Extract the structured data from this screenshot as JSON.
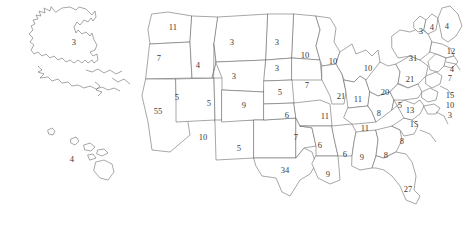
{
  "map": {
    "title": "United States electoral vote map",
    "background_color": "#ffffff",
    "outline_color": "#6b6b6b",
    "label_color": "#3a3a3a",
    "labels": [
      {
        "name": "alaska",
        "value": "3",
        "x": 74,
        "y": 42
      },
      {
        "name": "hawaii",
        "value": "4",
        "x": 72,
        "y": 159
      },
      {
        "name": "washington",
        "value": "11",
        "x": 173,
        "y": 27
      },
      {
        "name": "oregon",
        "value": "7",
        "x": 159,
        "y": 58
      },
      {
        "name": "california",
        "value": "55",
        "x": 158,
        "y": 111
      },
      {
        "name": "idaho",
        "value": "4",
        "x": 198,
        "y": 65
      },
      {
        "name": "nevada",
        "value": "5",
        "x": 177,
        "y": 97
      },
      {
        "name": "utah",
        "value": "5",
        "x": 209,
        "y": 103
      },
      {
        "name": "arizona",
        "value": "10",
        "x": 203,
        "y": 137
      },
      {
        "name": "montana",
        "value": "3",
        "x": 232,
        "y": 42
      },
      {
        "name": "wyoming",
        "value": "3",
        "x": 234,
        "y": 76
      },
      {
        "name": "colorado",
        "value": "9",
        "x": 244,
        "y": 105
      },
      {
        "name": "new-mexico",
        "value": "5",
        "x": 239,
        "y": 148
      },
      {
        "name": "north-dakota",
        "value": "3",
        "x": 277,
        "y": 42
      },
      {
        "name": "south-dakota",
        "value": "3",
        "x": 277,
        "y": 68
      },
      {
        "name": "nebraska",
        "value": "5",
        "x": 280,
        "y": 92
      },
      {
        "name": "kansas",
        "value": "6",
        "x": 287,
        "y": 115
      },
      {
        "name": "oklahoma",
        "value": "7",
        "x": 296,
        "y": 137
      },
      {
        "name": "texas",
        "value": "34",
        "x": 285,
        "y": 170
      },
      {
        "name": "minnesota",
        "value": "10",
        "x": 305,
        "y": 55
      },
      {
        "name": "iowa",
        "value": "7",
        "x": 307,
        "y": 85
      },
      {
        "name": "missouri",
        "value": "11",
        "x": 325,
        "y": 116
      },
      {
        "name": "arkansas",
        "value": "6",
        "x": 320,
        "y": 145
      },
      {
        "name": "louisiana",
        "value": "9",
        "x": 328,
        "y": 174
      },
      {
        "name": "wisconsin",
        "value": "10",
        "x": 333,
        "y": 61
      },
      {
        "name": "illinois",
        "value": "21",
        "x": 341,
        "y": 96
      },
      {
        "name": "mississippi",
        "value": "6",
        "x": 345,
        "y": 154
      },
      {
        "name": "michigan",
        "value": "10",
        "x": 368,
        "y": 68
      },
      {
        "name": "indiana",
        "value": "11",
        "x": 358,
        "y": 99
      },
      {
        "name": "tennessee",
        "value": "11",
        "x": 365,
        "y": 128
      },
      {
        "name": "alabama",
        "value": "9",
        "x": 362,
        "y": 157
      },
      {
        "name": "ohio",
        "value": "20",
        "x": 385,
        "y": 92
      },
      {
        "name": "kentucky",
        "value": "8",
        "x": 379,
        "y": 113
      },
      {
        "name": "georgia",
        "value": "8",
        "x": 386,
        "y": 155
      },
      {
        "name": "florida",
        "value": "27",
        "x": 408,
        "y": 189
      },
      {
        "name": "west-virginia",
        "value": "5",
        "x": 400,
        "y": 105
      },
      {
        "name": "south-carolina",
        "value": "8",
        "x": 402,
        "y": 141
      },
      {
        "name": "north-carolina",
        "value": "15",
        "x": 414,
        "y": 124
      },
      {
        "name": "virginia",
        "value": "13",
        "x": 410,
        "y": 110
      },
      {
        "name": "pennsylvania",
        "value": "21",
        "x": 410,
        "y": 79
      },
      {
        "name": "new-york",
        "value": "31",
        "x": 413,
        "y": 58
      },
      {
        "name": "vermont",
        "value": "3",
        "x": 421,
        "y": 31
      },
      {
        "name": "new-hampshire",
        "value": "4",
        "x": 432,
        "y": 27
      },
      {
        "name": "maine",
        "value": "4",
        "x": 447,
        "y": 26
      },
      {
        "name": "massachusetts",
        "value": "12",
        "x": 451,
        "y": 51
      },
      {
        "name": "rhode-island",
        "value": "4",
        "x": 452,
        "y": 69
      },
      {
        "name": "connecticut",
        "value": "7",
        "x": 450,
        "y": 78
      },
      {
        "name": "new-jersey",
        "value": "15",
        "x": 450,
        "y": 95
      },
      {
        "name": "maryland",
        "value": "10",
        "x": 450,
        "y": 105
      },
      {
        "name": "delaware",
        "value": "3",
        "x": 450,
        "y": 115
      }
    ]
  }
}
